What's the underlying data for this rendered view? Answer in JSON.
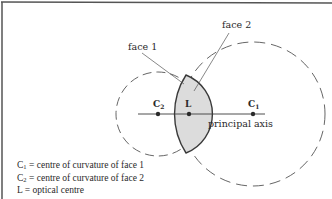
{
  "diagram": {
    "labels": {
      "face1": "face 1",
      "face2": "face 2",
      "c1": "C",
      "c1_sub": "1",
      "c2": "C",
      "c2_sub": "2",
      "l": "L",
      "axis": "principal axis"
    },
    "legend": [
      {
        "symbol": "C",
        "sub": "1",
        "text": " = centre of curvature of face 1"
      },
      {
        "symbol": "C",
        "sub": "2",
        "text": " = centre of curvature of face 2"
      },
      {
        "symbol": "L",
        "sub": "",
        "text": " = optical centre"
      }
    ],
    "colors": {
      "line": "#3a3a3a",
      "lens_fill": "#dcdcdc",
      "frame": "#555555"
    }
  }
}
